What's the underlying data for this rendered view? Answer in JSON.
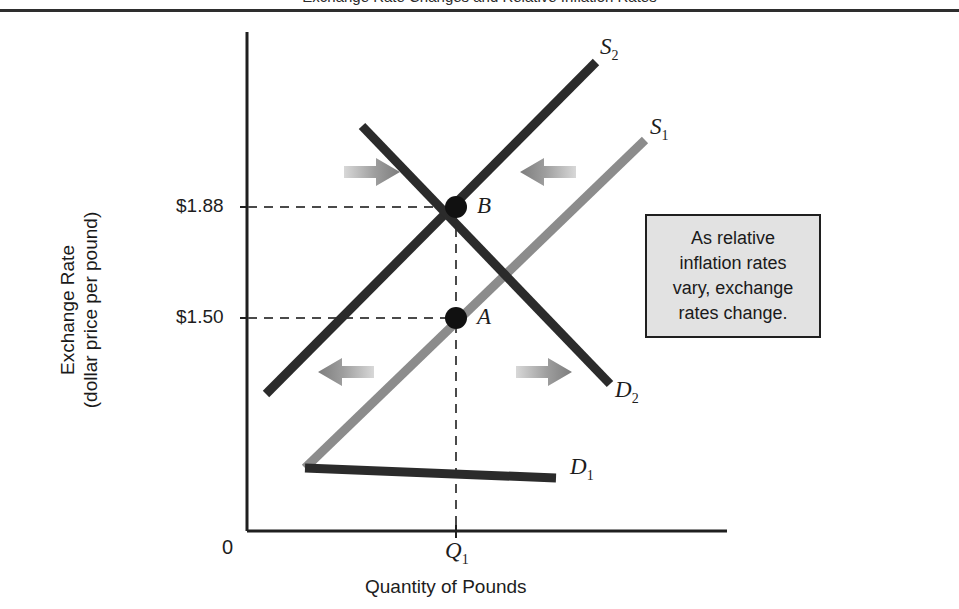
{
  "figure": {
    "caption": "Exchange Rate Changes and Relative Inflation Rates",
    "origin_label": "0"
  },
  "axes": {
    "y_title_line1": "Exchange Rate",
    "y_title_line2": "(dollar price per pound)",
    "x_title": "Quantity of Pounds",
    "y_ticks": [
      "$1.88",
      "$1.50"
    ],
    "x_ticks": [
      "Q",
      "1"
    ]
  },
  "callout": {
    "line1": "As relative",
    "line2": "inflation rates",
    "line3": "vary, exchange",
    "line4": "rates change."
  },
  "labels": {
    "supply_2": "S",
    "supply_2_sub": "2",
    "supply_1": "S",
    "supply_1_sub": "1",
    "demand_2": "D",
    "demand_2_sub": "2",
    "demand_1": "D",
    "demand_1_sub": "1",
    "point_a": "A",
    "point_b": "B",
    "q1": "Q",
    "q1_sub": "1"
  },
  "colors": {
    "axis": "#1f1f1f",
    "curve_dark": "#2b2b2b",
    "curve_gray": "#8c8c8c",
    "arrow_gray": "#9a9a9a",
    "callout_bg": "#e2e2e2",
    "dash": "#4a4a4a"
  },
  "chart_data": {
    "type": "line",
    "title": "Exchange Rate Changes and Relative Inflation Rates",
    "xlabel": "Quantity of Pounds",
    "ylabel": "Exchange Rate (dollar price per pound)",
    "grid": false,
    "legend": "inline curve labels",
    "y_tick_values": [
      1.5,
      1.88
    ],
    "y_tick_labels": [
      "$1.50",
      "$1.88"
    ],
    "x_tick_labels": [
      "0",
      "Q1"
    ],
    "equilibria": [
      {
        "name": "A",
        "price": 1.5,
        "quantity": "Q1",
        "curves": [
          "S1",
          "D1"
        ]
      },
      {
        "name": "B",
        "price": 1.88,
        "quantity": "Q1",
        "curves": [
          "S2",
          "D2"
        ]
      }
    ],
    "series": [
      {
        "name": "S1",
        "kind": "supply",
        "color": "#8c8c8c",
        "slope": "upward",
        "points_px": [
          [
            305,
            468
          ],
          [
            456,
            318
          ],
          [
            645,
            140
          ]
        ]
      },
      {
        "name": "S2",
        "kind": "supply",
        "color": "#2b2b2b",
        "slope": "upward",
        "points_px": [
          [
            266,
            394
          ],
          [
            456,
            207
          ],
          [
            596,
            62
          ]
        ]
      },
      {
        "name": "D1",
        "kind": "demand",
        "color": "#2b2b2b",
        "slope": "downward",
        "points_px": [
          [
            305,
            468
          ],
          [
            456,
            318
          ],
          [
            556,
            478
          ]
        ]
      },
      {
        "name": "D2",
        "kind": "demand",
        "color": "#2b2b2b",
        "slope": "downward",
        "points_px": [
          [
            362,
            126
          ],
          [
            456,
            207
          ],
          [
            610,
            384
          ]
        ]
      }
    ],
    "shift_arrows": [
      {
        "id": "supply-shift-in-left",
        "direction": "right",
        "region": "upper-left"
      },
      {
        "id": "supply-shift-in-right",
        "direction": "left",
        "region": "upper-right"
      },
      {
        "id": "demand-shift-out-left",
        "direction": "left",
        "region": "lower-left"
      },
      {
        "id": "demand-shift-out-right",
        "direction": "right",
        "region": "lower-right"
      }
    ],
    "annotation": "As relative inflation rates vary, exchange rates change."
  }
}
